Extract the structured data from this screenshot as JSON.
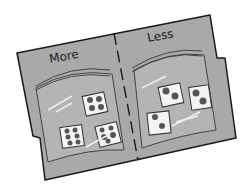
{
  "illustration": {
    "subject": "file folder with two zip bags of picture cards",
    "colors": {
      "folder": "#a9a9a9",
      "outline": "#1a1a1a",
      "card": "#f4f4f4",
      "item": "#555555",
      "background": "#ffffff"
    },
    "left_panel": {
      "label": "More",
      "cards": [
        {
          "items": 4
        },
        {
          "items": 6
        },
        {
          "items": 5
        }
      ]
    },
    "right_panel": {
      "label": "Less",
      "cards": [
        {
          "items": 2
        },
        {
          "items": 2
        },
        {
          "items": 2
        }
      ]
    }
  }
}
